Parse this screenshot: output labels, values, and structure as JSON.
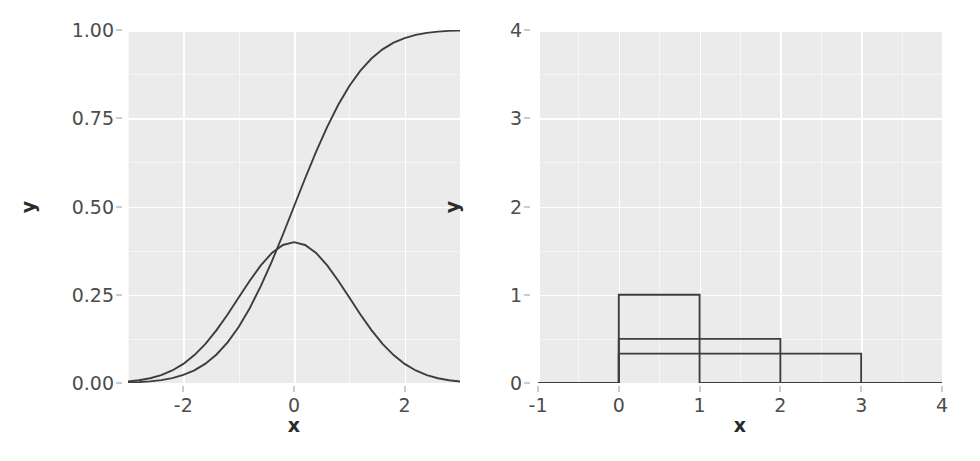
{
  "figure": {
    "width": 980,
    "height": 461,
    "background": "#ffffff",
    "panel_fill": "#ebebeb",
    "grid_major_color": "#ffffff",
    "grid_minor_color": "#f6f6f6",
    "line_color": "#3d3d3d",
    "tick_label_color": "#4d4d4d",
    "axis_title_color": "#2b2b2b"
  },
  "chart_data": [
    {
      "type": "line",
      "panel": "left",
      "title": "",
      "xlabel": "x",
      "ylabel": "y",
      "xlim": [
        -3,
        3
      ],
      "ylim": [
        0,
        1
      ],
      "xticks": [
        -2,
        0,
        2
      ],
      "xticklabels": [
        "-2",
        "0",
        "2"
      ],
      "yticks": [
        0,
        0.25,
        0.5,
        0.75,
        1
      ],
      "yticklabels": [
        "0.00",
        "0.25",
        "0.50",
        "0.75",
        "1.00"
      ],
      "x_minor": [
        -3,
        -1,
        1,
        3
      ],
      "y_minor": [
        0.125,
        0.375,
        0.625,
        0.875
      ],
      "grid": true,
      "legend": "none",
      "series": [
        {
          "name": "normal-pdf",
          "label": "Normal density (mean 0, sd 1)",
          "color": "#3d3d3d",
          "x": [
            -3,
            -2.8,
            -2.6,
            -2.4,
            -2.2,
            -2,
            -1.8,
            -1.6,
            -1.4,
            -1.2,
            -1,
            -0.8,
            -0.6,
            -0.4,
            -0.2,
            0,
            0.2,
            0.4,
            0.6,
            0.8,
            1,
            1.2,
            1.4,
            1.6,
            1.8,
            2,
            2.2,
            2.4,
            2.6,
            2.8,
            3
          ],
          "values": [
            0.0044,
            0.0079,
            0.0136,
            0.0224,
            0.0355,
            0.054,
            0.079,
            0.1109,
            0.1497,
            0.1942,
            0.242,
            0.2897,
            0.3332,
            0.3683,
            0.391,
            0.3989,
            0.391,
            0.3683,
            0.3332,
            0.2897,
            0.242,
            0.1942,
            0.1497,
            0.1109,
            0.079,
            0.054,
            0.0355,
            0.0224,
            0.0136,
            0.0079,
            0.0044
          ]
        },
        {
          "name": "normal-cdf",
          "label": "Normal distribution function (mean 0, sd 1)",
          "color": "#3d3d3d",
          "x": [
            -3,
            -2.8,
            -2.6,
            -2.4,
            -2.2,
            -2,
            -1.8,
            -1.6,
            -1.4,
            -1.2,
            -1,
            -0.8,
            -0.6,
            -0.4,
            -0.2,
            0,
            0.2,
            0.4,
            0.6,
            0.8,
            1,
            1.2,
            1.4,
            1.6,
            1.8,
            2,
            2.2,
            2.4,
            2.6,
            2.8,
            3
          ],
          "values": [
            0.0013,
            0.0026,
            0.0047,
            0.0082,
            0.0139,
            0.0228,
            0.0359,
            0.0548,
            0.0808,
            0.1151,
            0.1587,
            0.2119,
            0.2743,
            0.3446,
            0.4207,
            0.5,
            0.5793,
            0.6554,
            0.7257,
            0.7881,
            0.8413,
            0.8849,
            0.9192,
            0.9452,
            0.9641,
            0.9772,
            0.9861,
            0.9918,
            0.9953,
            0.9974,
            0.9987
          ]
        }
      ]
    },
    {
      "type": "line",
      "panel": "right",
      "title": "",
      "xlabel": "x",
      "ylabel": "y",
      "xlim": [
        -1,
        4
      ],
      "ylim": [
        0,
        4
      ],
      "xticks": [
        -1,
        0,
        1,
        2,
        3,
        4
      ],
      "xticklabels": [
        "-1",
        "0",
        "1",
        "2",
        "3",
        "4"
      ],
      "yticks": [
        0,
        1,
        2,
        3,
        4
      ],
      "yticklabels": [
        "0",
        "1",
        "2",
        "3",
        "4"
      ],
      "x_minor": [
        -0.5,
        0.5,
        1.5,
        2.5,
        3.5
      ],
      "y_minor": [
        0.5,
        1.5,
        2.5,
        3.5
      ],
      "grid": true,
      "legend": "none",
      "series": [
        {
          "name": "uniform-0-1-pdf",
          "label": "Uniform density on [0, 1]",
          "color": "#3d3d3d",
          "x": [
            -1,
            0,
            0,
            1,
            1,
            4
          ],
          "values": [
            0,
            0,
            1,
            1,
            0,
            0
          ]
        },
        {
          "name": "uniform-0-2-pdf",
          "label": "Uniform density on [0, 2]",
          "color": "#3d3d3d",
          "x": [
            -1,
            0,
            0,
            2,
            2,
            4
          ],
          "values": [
            0,
            0,
            0.5,
            0.5,
            0,
            0
          ]
        },
        {
          "name": "uniform-0-3-pdf",
          "label": "Uniform density on [0, 3]",
          "color": "#3d3d3d",
          "x": [
            -1,
            0,
            0,
            3,
            3,
            4
          ],
          "values": [
            0,
            0,
            0.3333,
            0.3333,
            0,
            0
          ]
        }
      ]
    }
  ]
}
